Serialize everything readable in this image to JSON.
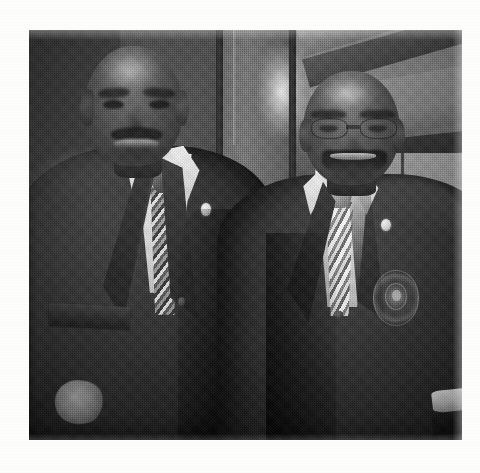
{
  "document": {
    "type": "scanned-photograph",
    "page_background": "#fdfdfc",
    "alt_text": "Black and white halftone-printed photograph of two men in dark suits standing side by side indoors"
  },
  "photo": {
    "name": "two-men-in-suits-photograph",
    "color_mode": "grayscale",
    "print_style": "halftone-screen",
    "frame": {
      "x": 29,
      "y": 30,
      "width": 433,
      "height": 410
    },
    "tones": {
      "highlight": "#f2f2ee",
      "midtone": "#8e8e8c",
      "shadow": "#2b2b29",
      "deep_shadow": "#1d1d1c"
    },
    "background": {
      "setting": "indoor auditorium / arena concourse",
      "elements": [
        "dark wall panel at left",
        "lit vertical door frame panel at center",
        "vertical poles",
        "sloped ceiling beams upper right",
        "light wall panels with mullions",
        "blurred crowd at far right"
      ]
    },
    "subjects": [
      {
        "position": "left",
        "description": "man in dark suit, smiling, mustache, short hair",
        "attire": {
          "jacket": "dark charcoal two-button suit jacket",
          "shirt": "white dress shirt",
          "tie": "light patterned necktie",
          "lapel_pin": "small light-colored lapel pin"
        },
        "details": [
          "mustache",
          "open smile",
          "pocket flap",
          "hand visible at lower left"
        ]
      },
      {
        "position": "right",
        "description": "man in dark blazer, broad smile, eyeglasses, balding",
        "attire": {
          "jacket": "dark navy blazer with circular crest badge on pocket",
          "shirt": "white dress shirt with visible cuff",
          "tie": "light patterned necktie",
          "lapel_pin": "small light-colored lapel pin",
          "eyewear": "eyeglasses"
        },
        "details": [
          "circular embroidered blazer crest",
          "broad smile showing teeth",
          "white shirt cuff at lower right"
        ]
      }
    ]
  }
}
